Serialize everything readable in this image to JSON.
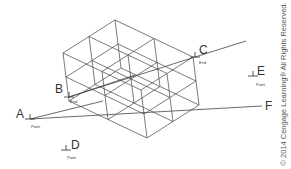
{
  "diagram": {
    "colors": {
      "line": "#444444",
      "text": "#333333",
      "background": "#ffffff"
    },
    "box": {
      "origin": [
        115,
        20
      ],
      "u": [
        -52,
        33
      ],
      "v": [
        78,
        37
      ],
      "h": [
        6,
        48
      ],
      "subdivisions": 2
    },
    "points": [
      {
        "id": "A",
        "label": "A",
        "tag": "Point",
        "x": 30,
        "y": 119
      },
      {
        "id": "B",
        "label": "B",
        "tag": "End",
        "x": 69,
        "y": 97
      },
      {
        "id": "C",
        "label": "C",
        "tag": "End",
        "x": 195,
        "y": 57
      },
      {
        "id": "D",
        "label": "D",
        "tag": "Point",
        "x": 66,
        "y": 150
      },
      {
        "id": "E",
        "label": "E",
        "tag": "Point",
        "x": 253,
        "y": 76
      },
      {
        "id": "F",
        "label": "F",
        "tag": "",
        "x": 263,
        "y": 106
      }
    ],
    "lines": [
      {
        "from": [
          30,
          119
        ],
        "to": [
          262,
          106
        ]
      },
      {
        "from": [
          30,
          119
        ],
        "to": [
          103,
          101
        ]
      },
      {
        "from": [
          69,
          97
        ],
        "to": [
          195,
          57
        ]
      },
      {
        "from": [
          69,
          97
        ],
        "to": [
          135,
          75
        ]
      },
      {
        "from": [
          195,
          57
        ],
        "to": [
          246,
          41
        ]
      }
    ],
    "copyright": "© 2014 Cengage Learning® All Rights Reserved."
  }
}
